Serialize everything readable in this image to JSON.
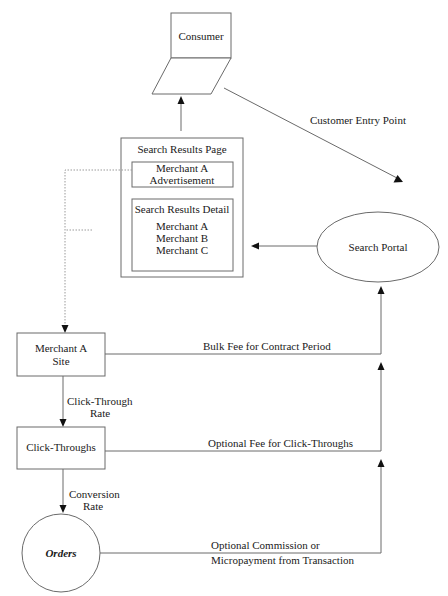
{
  "diagram": {
    "nodes": {
      "consumer": {
        "label": "Consumer"
      },
      "search_results_page": {
        "title": "Search Results Page",
        "advertisement": {
          "line1": "Merchant A",
          "line2": "Advertisement"
        },
        "detail": {
          "title": "Search Results Detail",
          "items": [
            "Merchant A",
            "Merchant B",
            "Merchant C"
          ]
        }
      },
      "search_portal": {
        "label": "Search Portal"
      },
      "merchant_site": {
        "line1": "Merchant A",
        "line2": "Site"
      },
      "click_throughs": {
        "label": "Click-Throughs"
      },
      "orders": {
        "label": "Orders"
      }
    },
    "edges": {
      "customer_entry": {
        "label": "Customer Entry Point"
      },
      "click_through_rate": {
        "line1": "Click-Through",
        "line2": "Rate"
      },
      "conversion_rate": {
        "line1": "Conversion",
        "line2": "Rate"
      },
      "bulk_fee": {
        "label": "Bulk Fee for Contract Period"
      },
      "click_fee": {
        "label": "Optional Fee for Click-Throughs"
      },
      "commission": {
        "line1": "Optional Commission or",
        "line2": "Micropayment from Transaction"
      }
    }
  }
}
